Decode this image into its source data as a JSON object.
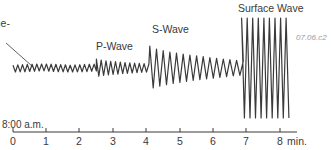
{
  "figure": {
    "figure_id": "07.06.c2",
    "callout_text": [
      "he",
      "ome-",
      "s."
    ],
    "wave_labels": [
      {
        "text": "P-Wave",
        "x": 96,
        "y": 41
      },
      {
        "text": "S-Wave",
        "x": 152,
        "y": 24
      },
      {
        "text": "Surface Wave",
        "x": 238,
        "y": 3
      }
    ],
    "time_axis": {
      "start_label": "8:00 a.m.",
      "unit": "min.",
      "ticks": [
        "0",
        "1",
        "2",
        "3",
        "4",
        "5",
        "6",
        "7",
        "8"
      ],
      "tick_x": [
        13,
        46,
        79,
        113,
        146,
        180,
        213,
        246,
        280
      ],
      "axis_end_x": 297,
      "axis_y": 132
    },
    "colors": {
      "trace": "#3a3a3a",
      "text": "#3a3a3a",
      "figure_id": "#9a9a9a"
    }
  },
  "chart_data": {
    "type": "line",
    "xlabel": "min.",
    "ylabel": "",
    "x_start_label": "8:00 a.m.",
    "x_ticks": [
      0,
      1,
      2,
      3,
      4,
      5,
      6,
      7,
      8
    ],
    "xlim": [
      0,
      8.5
    ],
    "annotations": [
      "P-Wave",
      "S-Wave",
      "Surface Wave",
      "07.06.c2"
    ],
    "segments": [
      {
        "name": "background noise",
        "t_start": 0.0,
        "t_end": 2.5,
        "amplitude": 4,
        "cycles_per_min": 7
      },
      {
        "name": "P-Wave",
        "t_start": 2.5,
        "t_end": 4.1,
        "amplitude": 9,
        "decaying_to": 4,
        "cycles_per_min": 7
      },
      {
        "name": "S-Wave",
        "t_start": 4.1,
        "t_end": 6.85,
        "amplitude": 22,
        "decaying_to": 7,
        "cycles_per_min": 5
      },
      {
        "name": "Surface Wave",
        "t_start": 6.85,
        "t_end": 8.3,
        "amplitude": 50,
        "cycles_per_min": 6
      }
    ]
  }
}
